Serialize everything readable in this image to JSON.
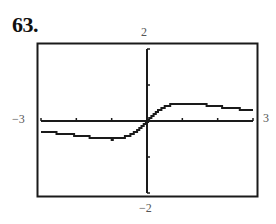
{
  "problem_number": "63.",
  "window": {
    "xmin_label": "−3",
    "xmax_label": "3",
    "ymax_label": "2",
    "ymin_label": "−2"
  },
  "chart_data": {
    "type": "line",
    "title": "",
    "xlabel": "",
    "ylabel": "",
    "xlim": [
      -3,
      3
    ],
    "ylim": [
      -2,
      2
    ],
    "x_ticks": [
      -3,
      -2,
      -1,
      0,
      1,
      2,
      3
    ],
    "y_ticks": [
      -2,
      -1,
      0,
      1,
      2
    ],
    "grid": false,
    "legend": null,
    "series": [
      {
        "name": "f(x)",
        "x": [
          -3,
          -2.5,
          -2,
          -1.5,
          -1,
          -0.75,
          -0.5,
          -0.25,
          0,
          0.25,
          0.5,
          0.75,
          1,
          1.5,
          2,
          2.5,
          3
        ],
        "y": [
          -0.3,
          -0.34,
          -0.4,
          -0.46,
          -0.5,
          -0.48,
          -0.4,
          -0.24,
          0,
          0.24,
          0.4,
          0.48,
          0.5,
          0.46,
          0.4,
          0.34,
          0.3
        ]
      }
    ],
    "style": {
      "line_color": "#1a1a1a",
      "frame_color": "#1a1a1a",
      "rendering": "calculator-pixel-steps"
    }
  }
}
